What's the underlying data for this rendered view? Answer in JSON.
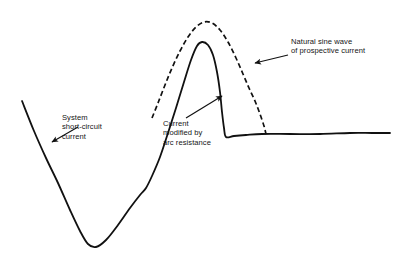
{
  "figure": {
    "name": "short-circuit-current-waveform",
    "background": "#ffffff",
    "stroke_color": "#111111",
    "text_color": "#151515",
    "width": 408,
    "height": 261
  },
  "annotations": {
    "system_short_circuit": {
      "line1": "System",
      "line2": "short-circuit",
      "line3": "current",
      "arrow_tail": [
        78,
        127
      ],
      "arrow_head": [
        52,
        142
      ]
    },
    "current_modified": {
      "line1": "Current",
      "line2": "modified by",
      "line3": "arc resistance",
      "arrow_tail": [
        186,
        118
      ],
      "arrow_head": [
        222,
        96
      ]
    },
    "natural_sine_wave": {
      "line1": "Natural sine wave",
      "line2": "of prospective current",
      "arrow_tail": [
        288,
        55
      ],
      "arrow_head": [
        255,
        63
      ]
    }
  },
  "chart_data": {
    "type": "line",
    "title": "",
    "xlabel": "",
    "ylabel": "",
    "grid": false,
    "legend": "annotations",
    "xlim": [
      0,
      408
    ],
    "ylim": [
      261,
      0
    ],
    "series": [
      {
        "name": "System short-circuit current (modified by arc resistance)",
        "style": "solid",
        "color": "#111111",
        "width": 1.8,
        "points": [
          [
            22,
            101
          ],
          [
            34,
            131
          ],
          [
            46,
            158
          ],
          [
            58,
            183
          ],
          [
            70,
            210
          ],
          [
            80,
            231
          ],
          [
            88,
            244
          ],
          [
            96,
            247
          ],
          [
            106,
            240
          ],
          [
            118,
            225
          ],
          [
            130,
            208
          ],
          [
            140,
            195
          ],
          [
            146,
            188
          ],
          [
            152,
            176
          ],
          [
            160,
            157
          ],
          [
            168,
            133
          ],
          [
            176,
            108
          ],
          [
            184,
            82
          ],
          [
            191,
            60
          ],
          [
            197,
            46
          ],
          [
            202,
            42
          ],
          [
            208,
            45
          ],
          [
            213,
            55
          ],
          [
            217,
            72
          ],
          [
            220,
            92
          ],
          [
            222,
            112
          ],
          [
            224,
            128
          ],
          [
            226,
            137
          ],
          [
            234,
            136
          ],
          [
            246,
            135
          ],
          [
            262,
            134
          ],
          [
            290,
            134
          ],
          [
            320,
            134
          ],
          [
            350,
            133
          ],
          [
            372,
            133
          ],
          [
            390,
            133
          ]
        ]
      },
      {
        "name": "Natural sine wave of prospective current",
        "style": "dashed",
        "color": "#111111",
        "width": 1.7,
        "dash": [
          5,
          3
        ],
        "points": [
          [
            152,
            118
          ],
          [
            158,
            103
          ],
          [
            165,
            85
          ],
          [
            172,
            68
          ],
          [
            180,
            51
          ],
          [
            188,
            37
          ],
          [
            196,
            27
          ],
          [
            204,
            22
          ],
          [
            212,
            23
          ],
          [
            220,
            30
          ],
          [
            228,
            42
          ],
          [
            236,
            58
          ],
          [
            243,
            74
          ],
          [
            249,
            88
          ],
          [
            255,
            101
          ],
          [
            260,
            114
          ],
          [
            264,
            126
          ],
          [
            266,
            134
          ]
        ]
      }
    ]
  }
}
